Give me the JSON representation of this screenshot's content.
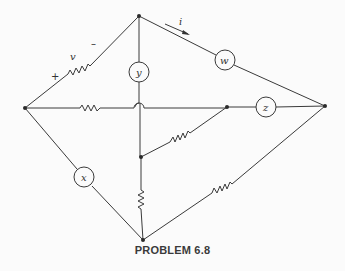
{
  "diagram": {
    "caption": "PROBLEM 6.8",
    "labels": {
      "v": "v",
      "plus": "+",
      "minus": "–",
      "i": "i",
      "w": "w",
      "y": "y",
      "z": "z",
      "x": "x"
    },
    "nodes": [
      {
        "id": "top",
        "x": 139,
        "y": 16
      },
      {
        "id": "left",
        "x": 25,
        "y": 108
      },
      {
        "id": "right",
        "x": 325,
        "y": 106
      },
      {
        "id": "mid",
        "x": 227,
        "y": 107
      },
      {
        "id": "inner",
        "x": 141,
        "y": 157
      },
      {
        "id": "bottom",
        "x": 143,
        "y": 240
      }
    ],
    "elements": [
      {
        "type": "resistor",
        "between": [
          "left",
          "top"
        ],
        "label": "v",
        "polarity": "+ at left, – at top"
      },
      {
        "type": "source",
        "label": "y",
        "between": [
          "top",
          "inner"
        ]
      },
      {
        "type": "source",
        "label": "w",
        "between": [
          "top",
          "right"
        ],
        "current": "i"
      },
      {
        "type": "resistor",
        "between": [
          "left",
          "mid"
        ],
        "crosses_wire": true
      },
      {
        "type": "source",
        "label": "z",
        "between": [
          "mid",
          "right"
        ]
      },
      {
        "type": "resistor",
        "between": [
          "inner",
          "mid"
        ]
      },
      {
        "type": "resistor",
        "between": [
          "inner",
          "bottom"
        ]
      },
      {
        "type": "source",
        "label": "x",
        "between": [
          "left",
          "bottom"
        ]
      },
      {
        "type": "resistor",
        "between": [
          "bottom",
          "right"
        ]
      }
    ]
  }
}
